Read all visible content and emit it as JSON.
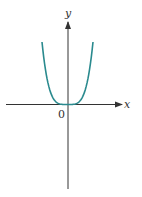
{
  "chart_data": {
    "type": "line",
    "title": "",
    "xlabel": "x",
    "ylabel": "y",
    "origin_label": "0",
    "function": "y = x^4",
    "grid": false,
    "legend": null,
    "series": [
      {
        "name": "curve",
        "color": "#2a8a8e",
        "x": [
          -1.0,
          -0.8,
          -0.6,
          -0.4,
          -0.2,
          0.0,
          0.2,
          0.4,
          0.6,
          0.8,
          1.0
        ],
        "y": [
          1.0,
          0.4096,
          0.1296,
          0.0256,
          0.0016,
          0.0,
          0.0016,
          0.0256,
          0.1296,
          0.4096,
          1.0
        ]
      }
    ],
    "xlim": [
      -2.4,
      2.1
    ],
    "ylim": [
      -1.37,
      1.32
    ]
  },
  "colors": {
    "curve": "#2a8a8e",
    "axes": "#333333"
  }
}
